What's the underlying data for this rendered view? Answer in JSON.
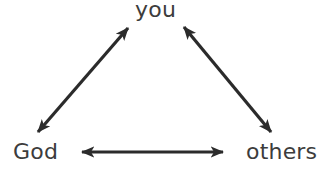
{
  "diagram": {
    "nodes": [
      {
        "id": "you",
        "label": "you"
      },
      {
        "id": "god",
        "label": "God"
      },
      {
        "id": "others",
        "label": "others"
      }
    ],
    "edges": [
      {
        "from": "god",
        "to": "you",
        "direction": "bidirectional"
      },
      {
        "from": "you",
        "to": "others",
        "direction": "bidirectional"
      },
      {
        "from": "god",
        "to": "others",
        "direction": "bidirectional"
      }
    ],
    "colors": {
      "arrow": "#2b2b2b",
      "text": "#3c3c3c",
      "background": "#ffffff"
    }
  }
}
